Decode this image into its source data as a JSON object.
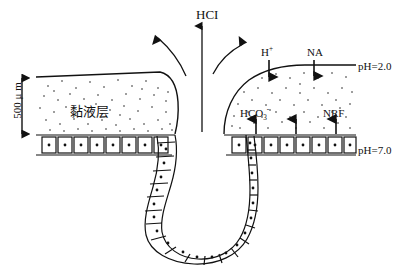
{
  "diagram": {
    "colors": {
      "line": "#111111",
      "background": "#ffffff",
      "stipple": "#222222"
    },
    "labels": {
      "hcl": "HCI",
      "h_plus": "H",
      "h_plus_sup": "+",
      "na": "NA",
      "ph_top": "pH=2.0",
      "hco3_main": "HCO",
      "hco3_sub": "3",
      "hco3_sup": "-",
      "nrf": "NRF",
      "ph_bottom": "pH=7.0",
      "mucus_layer": "黏液层",
      "scale": "500 μ m"
    },
    "arrows": {
      "hcl_vertical": "up",
      "curved_left": "up-left",
      "curved_right": "up-right",
      "h_plus_arrow": "down",
      "na_arrow": "down",
      "hco3_arrows": "up",
      "nrf_arrow": "up",
      "scale_arrow": "double-vertical"
    },
    "structures": {
      "mucus_left": "stippled mucus layer left of gastric pit",
      "mucus_right": "stippled mucus layer right of gastric pit",
      "epithelium": "row of epithelial cells with nuclei",
      "gastric_pit": "U-shaped gastric pit lined with cells"
    }
  }
}
